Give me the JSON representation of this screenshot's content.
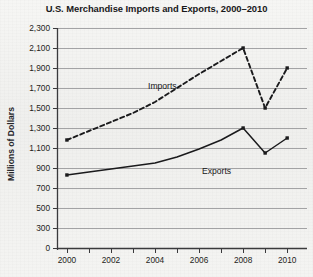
{
  "chart_data": {
    "type": "line",
    "title": "U.S. Merchandise Imports and Exports, 2000–2010",
    "xlabel": "",
    "ylabel": "Millions of Dollars",
    "x": [
      2000,
      2001,
      2002,
      2003,
      2004,
      2005,
      2006,
      2007,
      2008,
      2009,
      2010
    ],
    "xlim": [
      1999.55,
      2010.9
    ],
    "ylim": [
      0,
      2300
    ],
    "y_tick_values": [
      0,
      300,
      500,
      700,
      900,
      1100,
      1300,
      1500,
      1700,
      1900,
      2100,
      2300
    ],
    "y_tick_labels": [
      "0",
      "300",
      "500",
      "700",
      "900",
      "1,100",
      "1,300",
      "1,500",
      "1,700",
      "1,900",
      "2,100",
      "2,300"
    ],
    "x_tick_values": [
      2000,
      2001,
      2002,
      2003,
      2004,
      2005,
      2006,
      2007,
      2008,
      2009,
      2010
    ],
    "x_tick_labels": [
      "2000",
      "",
      "2002",
      "",
      "2004",
      "",
      "2006",
      "",
      "2008",
      "",
      "2010"
    ],
    "grid": "horizontal",
    "legend": "inline-annotations",
    "series": [
      {
        "name": "Imports",
        "style": "dashed",
        "color": "#1a1a1c",
        "values": [
          1180,
          1270,
          1360,
          1450,
          1560,
          1700,
          1840,
          1970,
          2100,
          1500,
          1900
        ]
      },
      {
        "name": "Exports",
        "style": "solid",
        "color": "#1a1a1c",
        "values": [
          830,
          860,
          890,
          920,
          950,
          1010,
          1090,
          1180,
          1300,
          1050,
          1200
        ]
      }
    ],
    "annotations": [
      {
        "name": "Imports",
        "x_px": 148,
        "y_px": 81
      },
      {
        "name": "Exports",
        "x_px": 202,
        "y_px": 166
      }
    ]
  },
  "geometry": {
    "plot_left": 57,
    "plot_right": 307,
    "plot_top": 28,
    "plot_bottom": 248,
    "axis_color": "#3a3a3c",
    "grid_color": "#9a9a9c"
  }
}
